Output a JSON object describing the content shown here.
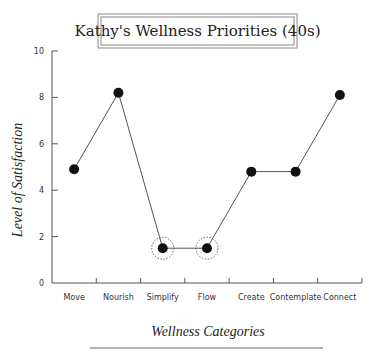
{
  "chart_data": {
    "type": "line",
    "title": "Kathy's Wellness Priorities (40s)",
    "xlabel": "Wellness Categories",
    "ylabel": "Level of Satisfaction",
    "categories": [
      "Move",
      "Nourish",
      "Simplify",
      "Flow",
      "Create",
      "Contemplate",
      "Connect"
    ],
    "series": [
      {
        "name": "Satisfaction",
        "values": [
          4.9,
          8.2,
          1.5,
          1.5,
          4.8,
          4.8,
          8.1
        ]
      }
    ],
    "highlighted": [
      "Simplify",
      "Flow"
    ],
    "ylim": [
      0,
      10
    ],
    "yticks": [
      0,
      2,
      4,
      6,
      8,
      10
    ],
    "grid": false,
    "legend": null
  },
  "colors": {
    "line": "#555555",
    "marker": "#111111",
    "axis": "#555555",
    "highlight_ring": "#666666"
  }
}
